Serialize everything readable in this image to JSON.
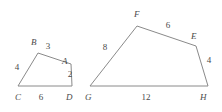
{
  "figure": {
    "stroke_color": "#8a8a8a",
    "text_color": "#4a4a4a",
    "background_color": "#ffffff",
    "shapes": [
      {
        "id": "quad-abcd",
        "name": "quadrilateral-ABCD",
        "points": "18,86 38,53 71,64 72,86",
        "vertices": [
          {
            "name": "C",
            "label": "C",
            "x": 15,
            "y": 100
          },
          {
            "name": "B",
            "label": "B",
            "x": 31,
            "y": 45
          },
          {
            "name": "A",
            "label": "A",
            "x": 62,
            "y": 64
          },
          {
            "name": "D",
            "label": "D",
            "x": 66,
            "y": 100
          }
        ],
        "sides": [
          {
            "name": "side-CB",
            "label": "4",
            "x": 17,
            "y": 70
          },
          {
            "name": "side-BA",
            "label": "3",
            "x": 48,
            "y": 49
          },
          {
            "name": "side-AD",
            "label": "2",
            "x": 68,
            "y": 77
          },
          {
            "name": "side-CD",
            "label": "6",
            "x": 41,
            "y": 100
          }
        ]
      },
      {
        "id": "quad-efgh",
        "name": "quadrilateral-EFGH",
        "points": "90,86 137,26 196,46 208,86",
        "vertices": [
          {
            "name": "G",
            "label": "G",
            "x": 85,
            "y": 100
          },
          {
            "name": "F",
            "label": "F",
            "x": 134,
            "y": 17
          },
          {
            "name": "E",
            "label": "E",
            "x": 191,
            "y": 39
          },
          {
            "name": "H",
            "label": "H",
            "x": 200,
            "y": 100
          }
        ],
        "sides": [
          {
            "name": "side-GF",
            "label": "8",
            "x": 105,
            "y": 50
          },
          {
            "name": "side-FE",
            "label": "6",
            "x": 168,
            "y": 28
          },
          {
            "name": "side-EH",
            "label": "4",
            "x": 207,
            "y": 63
          },
          {
            "name": "side-GH",
            "label": "12",
            "x": 144,
            "y": 100
          }
        ]
      }
    ]
  }
}
